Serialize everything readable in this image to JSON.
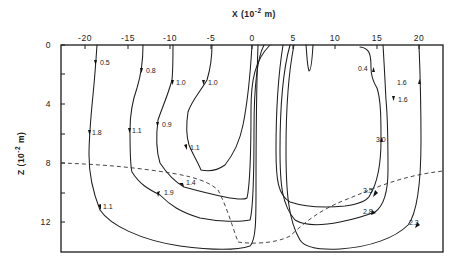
{
  "figure": {
    "x_axis": {
      "title": "X (10",
      "title_sup": "-2",
      "title_unit": " m)",
      "ticks": [
        {
          "label": "-20",
          "x": 85
        },
        {
          "label": "-15",
          "x": 128
        },
        {
          "label": "-10",
          "x": 170
        },
        {
          "label": "-5",
          "x": 211
        },
        {
          "label": "0",
          "x": 252
        },
        {
          "label": "5",
          "x": 293
        },
        {
          "label": "10",
          "x": 335
        },
        {
          "label": "15",
          "x": 377
        },
        {
          "label": "20",
          "x": 419
        }
      ]
    },
    "z_axis": {
      "title": "Z (10",
      "title_sup": "-2",
      "title_unit": " m)",
      "ticks": [
        {
          "label": "0",
          "y": 45
        },
        {
          "label": "4",
          "y": 104
        },
        {
          "label": "8",
          "y": 163
        },
        {
          "label": "12",
          "y": 222
        }
      ],
      "minor_ticks_y": [
        74,
        134,
        193
      ]
    },
    "streamline_labels": [
      {
        "id": "l05",
        "text": "0.5",
        "x": 100,
        "y": 65
      },
      {
        "id": "l08",
        "text": "0.8",
        "x": 146,
        "y": 73
      },
      {
        "id": "l10a",
        "text": "1.0",
        "x": 176,
        "y": 85
      },
      {
        "id": "l10b",
        "text": "1.0",
        "x": 208,
        "y": 85
      },
      {
        "id": "l18",
        "text": "1.8",
        "x": 92,
        "y": 135
      },
      {
        "id": "l11a",
        "text": "1.1",
        "x": 132,
        "y": 133
      },
      {
        "id": "l09",
        "text": "0.9",
        "x": 162,
        "y": 127
      },
      {
        "id": "l11b",
        "text": "1.1",
        "x": 190,
        "y": 150
      },
      {
        "id": "l14",
        "text": "1.4",
        "x": 186,
        "y": 185
      },
      {
        "id": "l19",
        "text": "1.9",
        "x": 164,
        "y": 195
      },
      {
        "id": "l11c",
        "text": "1.1",
        "x": 103,
        "y": 209
      },
      {
        "id": "l04",
        "text": "0.4",
        "x": 358,
        "y": 71
      },
      {
        "id": "l16a",
        "text": "1.6",
        "x": 397,
        "y": 85
      },
      {
        "id": "l16b",
        "text": "1.6",
        "x": 398,
        "y": 102
      },
      {
        "id": "l30",
        "text": "3.0",
        "x": 376,
        "y": 142
      },
      {
        "id": "l35",
        "text": "3.5",
        "x": 363,
        "y": 193
      },
      {
        "id": "l28",
        "text": "2.8",
        "x": 363,
        "y": 214
      },
      {
        "id": "l23",
        "text": "2.3",
        "x": 409,
        "y": 225
      }
    ]
  },
  "chart_data": {
    "type": "streamline-contour",
    "title": "",
    "xlabel": "X (10^-2 m)",
    "ylabel": "Z (10^-2 m)",
    "xlim": [
      -23,
      23
    ],
    "ylim": [
      14,
      0
    ],
    "x_ticks": [
      -20,
      -15,
      -10,
      -5,
      0,
      5,
      10,
      15,
      20
    ],
    "y_ticks": [
      0,
      4,
      8,
      12
    ],
    "left_cell_labels": [
      "0.5",
      "0.8",
      "1.0",
      "1.0",
      "1.8",
      "1.1",
      "0.9",
      "1.1",
      "1.4",
      "1.9",
      "1.1"
    ],
    "right_cell_labels": [
      "0.4",
      "1.6",
      "1.6",
      "3.0",
      "3.5",
      "2.8",
      "2.3"
    ],
    "dashed_boundary": "interface curve from Z≈8 at left wall, dipping to Z≈13.4 near X≈0..4, rising to Z≈6.8 at right wall"
  }
}
